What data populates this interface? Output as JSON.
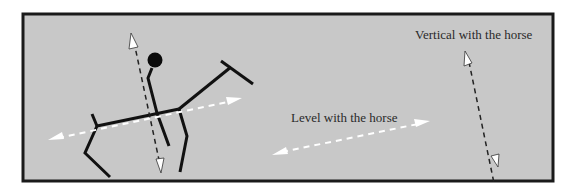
{
  "figure": {
    "labels": {
      "vertical": "Vertical with the horse",
      "level": "Level with the horse"
    },
    "colors": {
      "background": "#c8c8c8",
      "border": "#1a1a1a",
      "figure_lines": "#111111",
      "level_arrow": "#ffffff",
      "vertical_arrow": "#222222"
    },
    "elements": [
      "stick-figure horse",
      "stick-figure rider",
      "white dashed double arrow along horse's back (level)",
      "black dashed double arrow through rider (vertical)",
      "standalone white dashed double arrow (level legend)",
      "standalone black dashed double arrow (vertical legend)"
    ]
  }
}
